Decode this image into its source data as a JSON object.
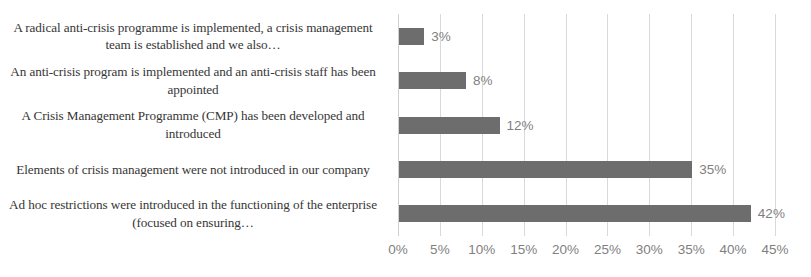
{
  "chart_data": {
    "type": "bar",
    "orientation": "horizontal",
    "title": "",
    "xlabel": "",
    "ylabel": "",
    "xlim": [
      0,
      45
    ],
    "xtick_labels": [
      "0%",
      "5%",
      "10%",
      "15%",
      "20%",
      "25%",
      "30%",
      "35%",
      "40%",
      "45%"
    ],
    "xtick_values": [
      0,
      5,
      10,
      15,
      20,
      25,
      30,
      35,
      40,
      45
    ],
    "grid": true,
    "grid_axis": "x",
    "legend": false,
    "bar_color": "#6d6d6d",
    "label_color": "#7f7f7f",
    "category_color": "#363636",
    "gridline_color": "#d9d9d9",
    "categories": [
      "A radical anti-crisis programme is implemented, a crisis management team is established and we also…",
      "An anti-crisis program is implemented and an anti-crisis staff has been appointed",
      "A Crisis Management Programme (CMP) has been developed and introduced",
      "Elements of crisis management were not introduced in our company",
      "Ad hoc restrictions were introduced in the functioning of the enterprise (focused on ensuring…"
    ],
    "values": [
      3,
      8,
      12,
      35,
      42
    ],
    "value_labels": [
      "3%",
      "8%",
      "12%",
      "35%",
      "42%"
    ]
  }
}
